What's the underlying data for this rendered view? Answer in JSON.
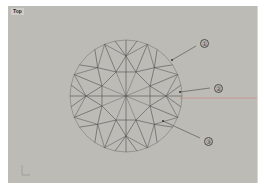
{
  "viewport": {
    "label": "Top",
    "background": "#bdbbb6",
    "axis_x_color": "#c98f8f",
    "line_color": "#4f4f4f",
    "outline_color": "#8a8a88"
  },
  "diamond": {
    "shape": "round brilliant (top view)",
    "center": [
      126,
      96
    ],
    "radius": 56,
    "table_radius": 26,
    "star_radius": 40,
    "symmetry": 8
  },
  "callouts": [
    {
      "label": "1",
      "text": "①",
      "x": 204,
      "y": 43,
      "leader_from": [
        196,
        46
      ],
      "leader_to": [
        172,
        60
      ]
    },
    {
      "label": "2",
      "text": "②",
      "x": 218,
      "y": 88,
      "leader_from": [
        210,
        88
      ],
      "leader_to": [
        180,
        92
      ]
    },
    {
      "label": "3",
      "text": "③",
      "x": 208,
      "y": 141,
      "leader_from": [
        200,
        138
      ],
      "leader_to": [
        163,
        121
      ]
    }
  ],
  "axis_icon": {
    "name": "world-axis-indicator"
  }
}
